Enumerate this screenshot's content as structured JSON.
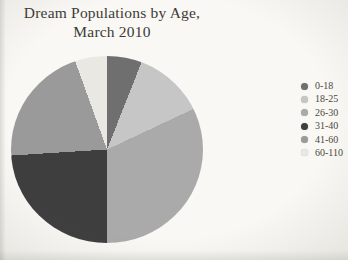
{
  "page": {
    "background_color": "#f9f8f4",
    "text_color": "#3e3b36"
  },
  "title": {
    "line1": "Dream Populations by Age,",
    "line2": "March 2010"
  },
  "chart_data": {
    "type": "pie",
    "title": "Dream Populations by Age, March 2010",
    "categories": [
      "0-18",
      "18-25",
      "26-30",
      "31-40",
      "41-60",
      "60-110"
    ],
    "values_percent": [
      6,
      12,
      32,
      24,
      20.5,
      5.5
    ],
    "colors": [
      "#6f6f6f",
      "#c6c6c6",
      "#aaaaaa",
      "#3e3e3e",
      "#9a9a9a",
      "#eae8e3"
    ],
    "start_angle_deg": 0,
    "direction": "clockwise",
    "legend_position": "right",
    "data_labels": false,
    "grid": false
  }
}
